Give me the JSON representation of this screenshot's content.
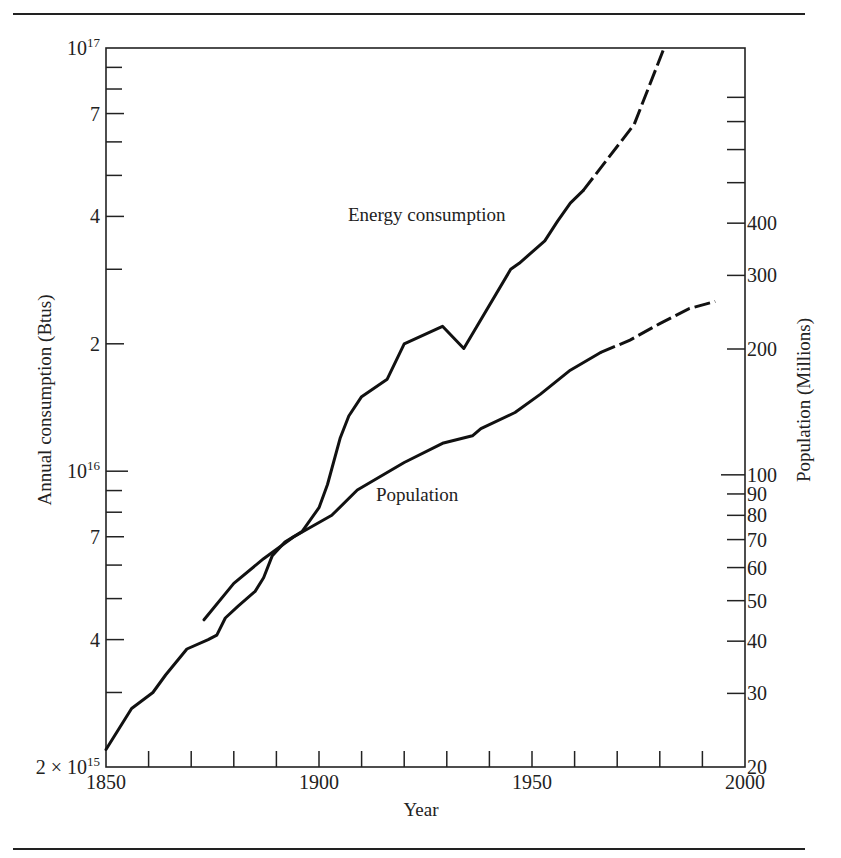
{
  "chart_data": {
    "type": "line",
    "title": "",
    "xlabel": "Year",
    "ylabel": "Annual consumption (Btus)",
    "ylabel_right": "Population (Millions)",
    "x_range": [
      1850,
      2000
    ],
    "x_ticks": [
      1850,
      1860,
      1870,
      1880,
      1890,
      1900,
      1910,
      1920,
      1930,
      1940,
      1950,
      1960,
      1970,
      1980,
      1990,
      2000
    ],
    "x_tick_labels": [
      "1850",
      "1900",
      "1950",
      "2000"
    ],
    "y_scale": "log",
    "ylim": [
      2000000000000000.0,
      1e+17
    ],
    "y_tick_labels": [
      {
        "value": 1e+17,
        "label": "10",
        "sup": "17"
      },
      {
        "value": 7e+16,
        "label": "7"
      },
      {
        "value": 4e+16,
        "label": "4"
      },
      {
        "value": 2e+16,
        "label": "2"
      },
      {
        "value": 1e+16,
        "label": "10",
        "sup": "16"
      },
      {
        "value": 7000000000000000.0,
        "label": "7"
      },
      {
        "value": 4000000000000000.0,
        "label": "4"
      },
      {
        "value": 2000000000000000.0,
        "label": "2 × 10",
        "sup": "15"
      }
    ],
    "y_minor_ticks": [
      9e+16,
      8e+16,
      6e+16,
      5e+16,
      3e+16,
      9000000000000000.0,
      8000000000000000.0,
      6000000000000000.0,
      5000000000000000.0,
      3000000000000000.0
    ],
    "y2_scale": "log",
    "y2lim": [
      20,
      1000
    ],
    "y2_tick_labels": [
      "20",
      "30",
      "40",
      "50",
      "60",
      "70",
      "80",
      "90",
      "100",
      "200",
      "300",
      "400"
    ],
    "y2_ticks": [
      20,
      30,
      40,
      50,
      60,
      70,
      80,
      90,
      100,
      200,
      300,
      400,
      500,
      600,
      700,
      800
    ],
    "grid": false,
    "legend": "inline labels",
    "series": [
      {
        "name": "Energy consumption",
        "axis": "left",
        "units": "Btus",
        "x": [
          1850,
          1856,
          1861,
          1864,
          1869,
          1874,
          1876,
          1878,
          1881,
          1885,
          1887,
          1889,
          1892,
          1896,
          1900,
          1902,
          1905,
          1907,
          1910,
          1916,
          1920,
          1929,
          1934,
          1945,
          1947,
          1953,
          1956,
          1959,
          1962,
          1974,
          1981
        ],
        "values": [
          2200000000000000.0,
          2750000000000000.0,
          3000000000000000.0,
          3300000000000000.0,
          3800000000000000.0,
          4000000000000000.0,
          4100000000000000.0,
          4500000000000000.0,
          4800000000000000.0,
          5200000000000000.0,
          5600000000000000.0,
          6300000000000000.0,
          6800000000000000.0,
          7200000000000000.0,
          8200000000000000.0,
          9300000000000000.0,
          1.2e+16,
          1.35e+16,
          1.5e+16,
          1.65e+16,
          2e+16,
          2.2e+16,
          1.95e+16,
          3e+16,
          3.1e+16,
          3.5e+16,
          3.9e+16,
          4.3e+16,
          4.6e+16,
          6.6e+16,
          1e+17
        ],
        "projected_from": 1972
      },
      {
        "name": "Population",
        "axis": "right",
        "units": "Millions",
        "x": [
          1873,
          1880,
          1887,
          1894,
          1903,
          1909,
          1920,
          1929,
          1936,
          1938,
          1946,
          1952,
          1959,
          1966,
          1973,
          1980,
          1987,
          1993
        ],
        "values": [
          45,
          55,
          63,
          71,
          80,
          92,
          107,
          119,
          124,
          129,
          141,
          156,
          178,
          196,
          210,
          230,
          250,
          260
        ],
        "projected_from": 1970
      }
    ]
  },
  "labels": {
    "energy": "Energy consumption",
    "population": "Population",
    "x_axis_title": "Year",
    "y_left_title": "Annual consumption (Btus)",
    "y_right_title": "Population (Millions)"
  }
}
